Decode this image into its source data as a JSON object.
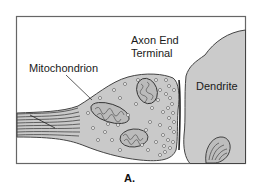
{
  "diagram": {
    "labels": {
      "mitochondrion": "Mitochondrion",
      "axon_terminal_line1": "Axon End",
      "axon_terminal_line2": "Terminal",
      "dendrite": "Dendrite"
    },
    "caption": "A.",
    "colors": {
      "cell_fill": "#c8c8c8",
      "outline": "#3a3a3a",
      "frame": "#555555",
      "background": "#ffffff"
    }
  }
}
